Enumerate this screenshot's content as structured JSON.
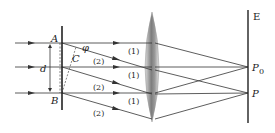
{
  "diagram": {
    "labels": {
      "A": "A",
      "B": "B",
      "C": "C",
      "d": "d",
      "phi": "φ",
      "E": "E",
      "P0": "P",
      "P0_sub": "0",
      "P": "P"
    },
    "ray_labels": {
      "r1a": "(1)",
      "r1b": "(1)",
      "r1c": "(1)",
      "r2a": "(2)",
      "r2b": "(2)",
      "r2c": "(2)"
    },
    "colors": {
      "line": "#333333",
      "lens_dark": "#8a8a8a",
      "lens_light": "#eeeeee"
    }
  }
}
